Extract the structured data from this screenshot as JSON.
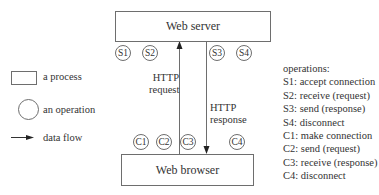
{
  "diagram": {
    "server_box": {
      "label": "Web server"
    },
    "browser_box": {
      "label": "Web browser"
    },
    "server_operations": [
      "S1",
      "S2",
      "S3",
      "S4"
    ],
    "client_operations": [
      "C1",
      "C2",
      "C3",
      "C4"
    ],
    "arrows": {
      "request": {
        "label_line1": "HTTP",
        "label_line2": "request",
        "direction": "up"
      },
      "response": {
        "label_line1": "HTTP",
        "label_line2": "response",
        "direction": "down"
      }
    },
    "legend": {
      "process": "a process",
      "operation": "an operation",
      "data_flow": "data flow"
    },
    "operations_list": {
      "title": "operations:",
      "items": [
        "S1: accept connection",
        "S2: receive (request)",
        "S3: send (response)",
        "S4: disconnect",
        "C1: make connection",
        "C2: send (request)",
        "C3: receive (response)",
        "C4: disconnect"
      ]
    },
    "colors": {
      "stroke": "#6e6e6e",
      "text": "#333333",
      "arrowhead": "#222222"
    }
  }
}
